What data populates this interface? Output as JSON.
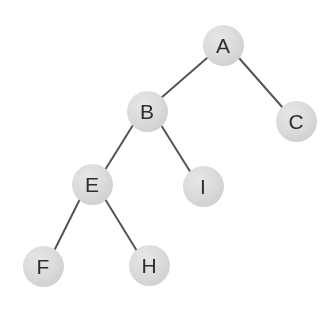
{
  "diagram": {
    "type": "tree",
    "background_color": "#ffffff",
    "node_fill_color": "#d9d9d9",
    "node_label_color": "#2e2e2e",
    "edge_color": "#555555",
    "node_diameter": 41,
    "edge_width": 2,
    "nodes": [
      {
        "id": "A",
        "label": "A",
        "cx": 223,
        "cy": 45,
        "r": 20.5
      },
      {
        "id": "B",
        "label": "B",
        "cx": 147,
        "cy": 111,
        "r": 20.5
      },
      {
        "id": "C",
        "label": "C",
        "cx": 296,
        "cy": 121,
        "r": 20.5
      },
      {
        "id": "E",
        "label": "E",
        "cx": 92,
        "cy": 184,
        "r": 20.5
      },
      {
        "id": "I",
        "label": "I",
        "cx": 203,
        "cy": 186,
        "r": 20.5
      },
      {
        "id": "F",
        "label": "F",
        "cx": 43,
        "cy": 266,
        "r": 20.5
      },
      {
        "id": "H",
        "label": "H",
        "cx": 149,
        "cy": 265,
        "r": 20.5
      }
    ],
    "edges": [
      {
        "from": "A",
        "to": "B",
        "x1": 207,
        "y1": 58,
        "x2": 161,
        "y2": 98
      },
      {
        "from": "A",
        "to": "C",
        "x1": 239,
        "y1": 58,
        "x2": 283,
        "y2": 108
      },
      {
        "from": "B",
        "to": "E",
        "x1": 133,
        "y1": 125,
        "x2": 105,
        "y2": 170
      },
      {
        "from": "B",
        "to": "I",
        "x1": 161,
        "y1": 125,
        "x2": 191,
        "y2": 173
      },
      {
        "from": "E",
        "to": "F",
        "x1": 80,
        "y1": 199,
        "x2": 54,
        "y2": 251
      },
      {
        "from": "E",
        "to": "H",
        "x1": 105,
        "y1": 199,
        "x2": 137,
        "y2": 251
      }
    ]
  }
}
